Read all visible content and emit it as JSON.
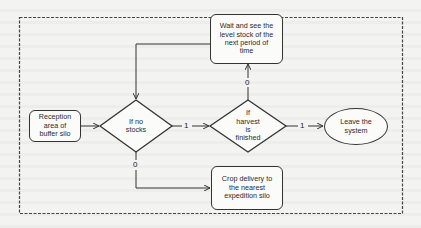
{
  "diagram": {
    "type": "flowchart",
    "nodes": {
      "reception": {
        "label": "Reception area of buffer silo",
        "lines": [
          "Reception",
          "area of",
          "buffer silo"
        ],
        "shape": "rounded-rect"
      },
      "if_no_stocks": {
        "label": "If no stocks",
        "lines": [
          "If no",
          "stocks"
        ],
        "shape": "diamond"
      },
      "if_harvest_finished": {
        "label": "If harvest is finished",
        "lines": [
          "If",
          "harvest",
          "is",
          "finished"
        ],
        "shape": "diamond"
      },
      "wait_and_see": {
        "label": "Wait and see the level stock of the next period of time",
        "lines": [
          "Wait and see  the",
          "level stock of the",
          "next period of",
          "time"
        ],
        "shape": "rounded-rect"
      },
      "leave_system": {
        "label": "Leave the system",
        "lines": [
          "Leave the",
          "system"
        ],
        "shape": "ellipse"
      },
      "crop_delivery": {
        "label": "Crop delivery to the nearest expedition silo",
        "lines": [
          "Crop delivery to",
          "the nearest",
          "expedition silo"
        ],
        "shape": "rounded-rect"
      }
    },
    "edges": [
      {
        "from": "reception",
        "to": "if_no_stocks",
        "label": ""
      },
      {
        "from": "if_no_stocks",
        "to": "if_harvest_finished",
        "label": "1"
      },
      {
        "from": "if_no_stocks",
        "to": "crop_delivery",
        "label": "0"
      },
      {
        "from": "if_harvest_finished",
        "to": "leave_system",
        "label": "1"
      },
      {
        "from": "if_harvest_finished",
        "to": "wait_and_see",
        "label": "0"
      },
      {
        "from": "wait_and_see",
        "to": "if_no_stocks",
        "label": ""
      }
    ],
    "edge_labels": {
      "no_stocks_yes": "1",
      "no_stocks_no": "0",
      "harvest_yes": "1",
      "harvest_no": "0"
    },
    "colors": {
      "stroke": "#333333",
      "frame": "#444444",
      "node_fill": "#fbfbfa",
      "background": "#f3f3f1"
    }
  }
}
